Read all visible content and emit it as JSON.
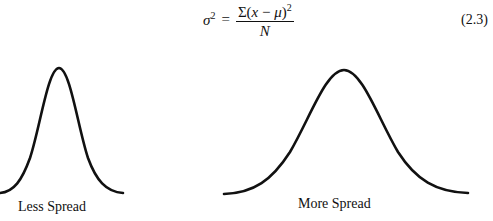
{
  "equation": {
    "lhs": "σ",
    "lhs_exp": "2",
    "equals": "=",
    "numerator_prefix": "Σ(",
    "numerator_var": "x",
    "numerator_minus": " − ",
    "numerator_mean": "μ",
    "numerator_suffix": ")",
    "numerator_exp": "2",
    "denominator": "N",
    "number": "(2.3)"
  },
  "figure": {
    "curves": [
      {
        "label": "Less Spread",
        "peak": [
          59,
          68
        ],
        "baseline_y": 193,
        "x_range": [
          0,
          123
        ]
      },
      {
        "label": "More Spread",
        "peak": [
          344,
          70
        ],
        "baseline_y": 194,
        "x_range": [
          224,
          468
        ]
      }
    ],
    "stroke_color": "#111111"
  }
}
